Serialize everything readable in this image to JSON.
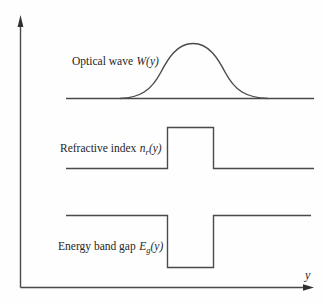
{
  "figure": {
    "axis": {
      "y_label": "y"
    },
    "colors": {
      "line": "#4a4a4a",
      "text": "#262626",
      "background": "#fefefe"
    },
    "curves": [
      {
        "name": "optical-wave",
        "label": "Optical wave",
        "symbol": "W",
        "subscript": "",
        "argument": "(y)",
        "shape": "gaussian-bump-above-baseline"
      },
      {
        "name": "refractive-index",
        "label": "Refractive index",
        "symbol": "n",
        "subscript": "r",
        "argument": "(y)",
        "shape": "rectangular-step-up"
      },
      {
        "name": "energy-band-gap",
        "label": "Energy band gap",
        "symbol": "E",
        "subscript": "g",
        "argument": "(y)",
        "shape": "rectangular-notch-down"
      }
    ]
  }
}
